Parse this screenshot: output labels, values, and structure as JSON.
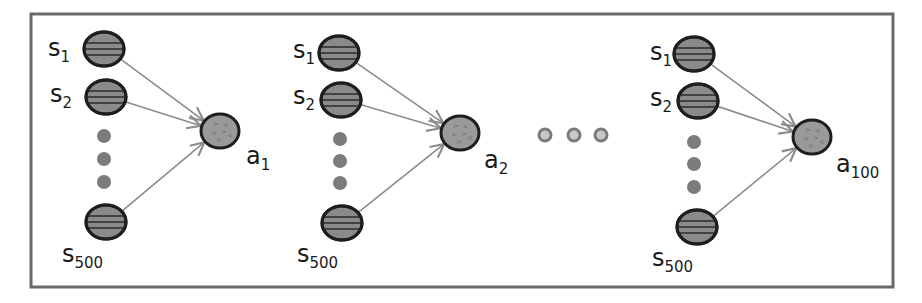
{
  "diagram": {
    "title": "",
    "frame": {
      "x": 31,
      "y": 14,
      "width": 862,
      "height": 273,
      "stroke": "#6a6a6a"
    },
    "colors": {
      "state_fill": "#8a8a8a",
      "action_fill": "#9a9a9a",
      "outline": "#1e1e1e",
      "edge": "#8c8c8c",
      "ellipsis_dot": "#7c7c7c"
    },
    "groups": [
      {
        "id": "group-1",
        "states": [
          {
            "label_base": "s",
            "label_sub": "1",
            "cx": 104,
            "cy": 49,
            "label_x": 48,
            "label_y": 56
          },
          {
            "label_base": "s",
            "label_sub": "2",
            "cx": 106,
            "cy": 97,
            "label_x": 50,
            "label_y": 102
          },
          {
            "label_base": "s",
            "label_sub": "500",
            "cx": 106,
            "cy": 222,
            "label_x": 62,
            "label_y": 262
          }
        ],
        "ellipsis_dots": [
          {
            "cx": 104,
            "cy": 136
          },
          {
            "cx": 104,
            "cy": 159
          },
          {
            "cx": 104,
            "cy": 182
          }
        ],
        "action": {
          "label_base": "a",
          "label_sub": "1",
          "cx": 220,
          "cy": 131,
          "label_x": 246,
          "label_y": 164
        }
      },
      {
        "id": "group-2",
        "states": [
          {
            "label_base": "s",
            "label_sub": "1",
            "cx": 339,
            "cy": 53,
            "label_x": 293,
            "label_y": 58
          },
          {
            "label_base": "s",
            "label_sub": "2",
            "cx": 341,
            "cy": 100,
            "label_x": 293,
            "label_y": 104
          },
          {
            "label_base": "s",
            "label_sub": "500",
            "cx": 342,
            "cy": 223,
            "label_x": 297,
            "label_y": 262
          }
        ],
        "ellipsis_dots": [
          {
            "cx": 340,
            "cy": 139
          },
          {
            "cx": 340,
            "cy": 161
          },
          {
            "cx": 340,
            "cy": 183
          }
        ],
        "action": {
          "label_base": "a",
          "label_sub": "2",
          "cx": 460,
          "cy": 133,
          "label_x": 484,
          "label_y": 168
        }
      },
      {
        "id": "group-3",
        "states": [
          {
            "label_base": "s",
            "label_sub": "1",
            "cx": 694,
            "cy": 54,
            "label_x": 650,
            "label_y": 60
          },
          {
            "label_base": "s",
            "label_sub": "2",
            "cx": 698,
            "cy": 101,
            "label_x": 650,
            "label_y": 106
          },
          {
            "label_base": "s",
            "label_sub": "500",
            "cx": 697,
            "cy": 227,
            "label_x": 652,
            "label_y": 266
          }
        ],
        "ellipsis_dots": [
          {
            "cx": 694,
            "cy": 142
          },
          {
            "cx": 694,
            "cy": 164
          },
          {
            "cx": 694,
            "cy": 187
          }
        ],
        "action": {
          "label_base": "a",
          "label_sub": "100",
          "cx": 812,
          "cy": 137,
          "label_x": 836,
          "label_y": 172
        }
      }
    ],
    "between_group_dots": [
      {
        "cx": 545,
        "cy": 135
      },
      {
        "cx": 574,
        "cy": 135
      },
      {
        "cx": 601,
        "cy": 135
      }
    ]
  }
}
